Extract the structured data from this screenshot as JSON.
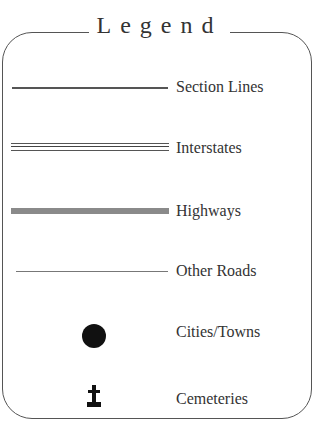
{
  "legend": {
    "title": "Legend",
    "items": [
      {
        "label": "Section Lines",
        "symbol": "thin-line"
      },
      {
        "label": "Interstates",
        "symbol": "double-line"
      },
      {
        "label": "Highways",
        "symbol": "thick-gray-line"
      },
      {
        "label": "Other Roads",
        "symbol": "hairline"
      },
      {
        "label": "Cities/Towns",
        "symbol": "filled-circle"
      },
      {
        "label": "Cemeteries",
        "symbol": "grave-cross"
      }
    ],
    "colors": {
      "line": "#555555",
      "highway": "#8a8a8a",
      "text": "#333333"
    }
  }
}
